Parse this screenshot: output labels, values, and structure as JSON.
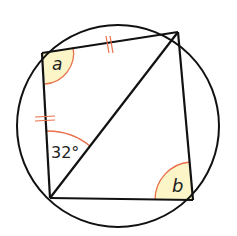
{
  "diagram": {
    "type": "cyclic-quadrilateral",
    "labels": {
      "angle_a": "a",
      "angle_b": "b",
      "given_angle": "32°"
    },
    "colors": {
      "line": "#111111",
      "arc": "#e8704a",
      "shade": "#fbf5c8",
      "tick": "#e8704a"
    }
  }
}
